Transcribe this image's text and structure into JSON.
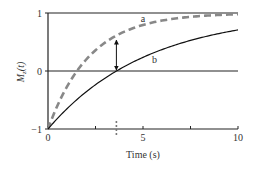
{
  "chart_data": {
    "type": "line",
    "title": "",
    "xlabel": "Time (s)",
    "ylabel": "M_z(t)",
    "xlim": [
      0,
      10
    ],
    "ylim": [
      -1,
      1
    ],
    "x_ticks": [
      0,
      2.5,
      5,
      7.5,
      10
    ],
    "x_tick_labels": [
      "0",
      "",
      "5",
      "",
      "10"
    ],
    "y_ticks": [
      -1,
      0,
      1
    ],
    "y_tick_labels": [
      "-1",
      "0",
      "1"
    ],
    "grid": false,
    "reference_lines": [
      {
        "orientation": "horizontal",
        "y": 1
      },
      {
        "orientation": "horizontal",
        "y": 0
      }
    ],
    "series": [
      {
        "name": "a",
        "style": "dashed",
        "color": "#888888",
        "formula": "1 - 2*exp(-t/2.2)",
        "x": [
          0,
          0.5,
          1,
          1.5,
          2,
          3,
          3.6,
          4,
          5,
          6,
          7,
          8,
          9,
          10
        ],
        "values": [
          -1,
          -0.59,
          -0.27,
          0.0,
          0.2,
          0.49,
          0.61,
          0.68,
          0.79,
          0.87,
          0.92,
          0.95,
          0.97,
          0.98
        ]
      },
      {
        "name": "b",
        "style": "solid",
        "color": "#111111",
        "formula": "1 - 2*exp(-t/5.2)",
        "x": [
          0,
          0.5,
          1,
          1.5,
          2,
          3,
          3.6,
          4,
          5,
          6,
          7,
          8,
          9,
          10
        ],
        "values": [
          -1,
          -0.83,
          -0.65,
          -0.5,
          -0.36,
          -0.12,
          0.0,
          0.07,
          0.24,
          0.37,
          0.48,
          0.57,
          0.65,
          0.71
        ]
      }
    ],
    "annotations": [
      {
        "type": "double-arrow",
        "x": 3.6,
        "y_from": 0.0,
        "y_to": 0.55
      },
      {
        "type": "dashed-marker",
        "x": 3.6,
        "note": "zero crossing of curve b"
      },
      {
        "type": "label",
        "text": "a",
        "x": 5.0,
        "y": 0.85
      },
      {
        "type": "label",
        "text": "b",
        "x": 5.6,
        "y": 0.14
      }
    ],
    "legend": "none"
  }
}
